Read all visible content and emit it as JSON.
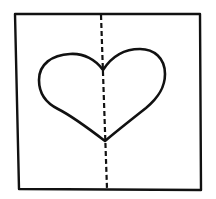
{
  "diagram": {
    "type": "symmetry-illustration",
    "colors": {
      "stroke": "#111111",
      "background": "#ffffff"
    },
    "elements": [
      {
        "id": "frame",
        "shape": "square"
      },
      {
        "id": "heart",
        "shape": "heart"
      },
      {
        "id": "symmetry-line",
        "shape": "dashed-line",
        "orientation": "vertical"
      }
    ]
  }
}
